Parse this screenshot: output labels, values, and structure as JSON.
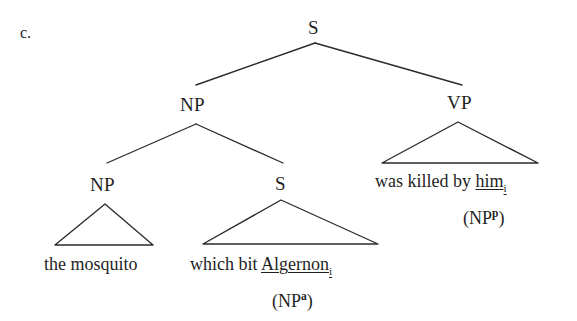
{
  "figure": {
    "item_label": "c.",
    "background_color": "#ffffff",
    "ink_color": "#1f1f1f",
    "line_color": "#2b2b2b"
  },
  "nodes": {
    "root_s": "S",
    "subject_np": "NP",
    "predicate_vp": "VP",
    "inner_np": "NP",
    "relative_s": "S"
  },
  "terminals": {
    "the_mosquito": "the mosquito",
    "relative_clause_prefix": "which bit ",
    "relative_clause_coindexed": "Algernon",
    "relative_clause_index": "i",
    "vp_prefix": "was killed by ",
    "vp_coindexed": "him",
    "vp_index": "i"
  },
  "role_annotations": {
    "agent_open": "(NP",
    "agent_superscript": "a",
    "agent_close": ")",
    "patient_open": "(NP",
    "patient_superscript": "p",
    "patient_close": ")"
  }
}
